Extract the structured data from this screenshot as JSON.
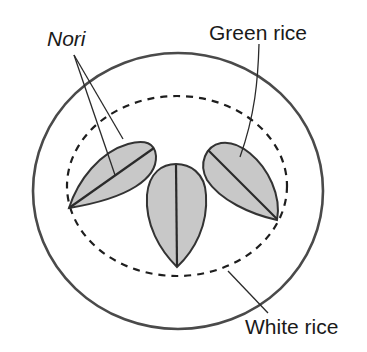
{
  "diagram": {
    "labels": {
      "nori": "Nori",
      "green_rice": "Green rice",
      "white_rice": "White rice"
    },
    "colors": {
      "outline": "#3a3a3a",
      "leaf_fill": "#c8c8c8",
      "background": "#ffffff",
      "text": "#1a1a1a"
    }
  }
}
